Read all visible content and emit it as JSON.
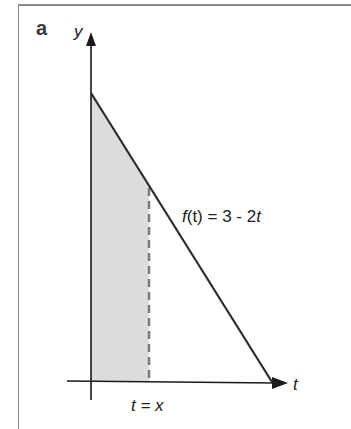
{
  "panel": {
    "label": "a"
  },
  "axes": {
    "y_label": "y",
    "x_label": "t"
  },
  "function": {
    "label_f": "f",
    "label_rest": "(t) = 3 - 2",
    "label_t": "t",
    "expression": "f(t) = 3 - 2t"
  },
  "marker": {
    "label": "t = x"
  },
  "colors": {
    "line": "#2b2b2b",
    "shade": "#dcdcdc",
    "dash": "#7a7a7a",
    "frame": "#8a8a8a"
  }
}
